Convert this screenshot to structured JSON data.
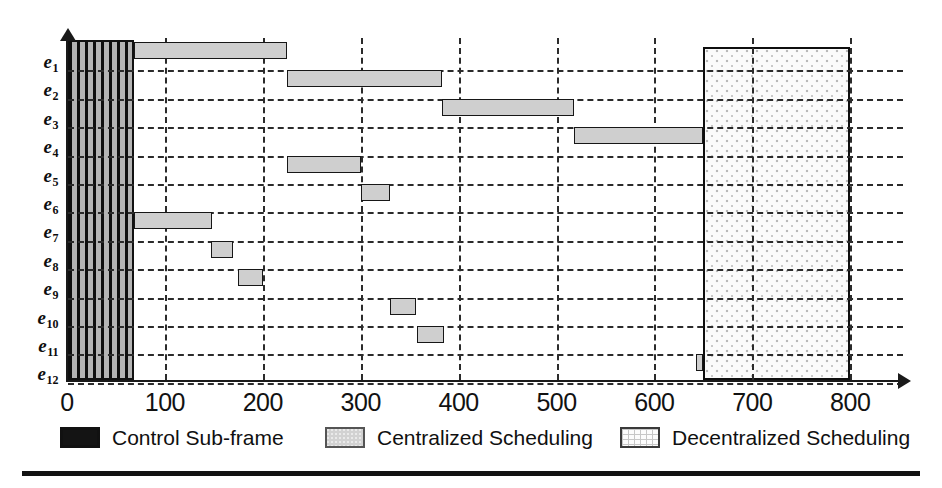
{
  "figure": {
    "title": "",
    "y_axis_label": "",
    "x_axis_label": ""
  },
  "chart_data": {
    "type": "bar",
    "orientation": "horizontal",
    "subtype": "gantt-schedule",
    "title": "",
    "xlabel": "",
    "ylabel": "",
    "xlim": [
      0,
      840
    ],
    "grid": true,
    "xticks": [
      0,
      100,
      200,
      300,
      400,
      500,
      600,
      700,
      800
    ],
    "xticklabels": [
      "0",
      "100",
      "200",
      "300",
      "400",
      "500",
      "600",
      "700",
      "800"
    ],
    "categories": [
      "e1",
      "e2",
      "e3",
      "e4",
      "e5",
      "e6",
      "e7",
      "e8",
      "e9",
      "e10",
      "e11",
      "e12"
    ],
    "category_labels": [
      {
        "base": "e",
        "sub": "1"
      },
      {
        "base": "e",
        "sub": "2"
      },
      {
        "base": "e",
        "sub": "3"
      },
      {
        "base": "e",
        "sub": "4"
      },
      {
        "base": "e",
        "sub": "5"
      },
      {
        "base": "e",
        "sub": "6"
      },
      {
        "base": "e",
        "sub": "7"
      },
      {
        "base": "e",
        "sub": "8"
      },
      {
        "base": "e",
        "sub": "9"
      },
      {
        "base": "e",
        "sub": "10"
      },
      {
        "base": "e",
        "sub": "11"
      },
      {
        "base": "e",
        "sub": "12"
      }
    ],
    "series": [
      {
        "name": "Centralized Scheduling",
        "color": "#cfcfcf",
        "tasks": [
          {
            "category": "e1",
            "start": 68,
            "end": 225
          },
          {
            "category": "e2",
            "start": 225,
            "end": 383
          },
          {
            "category": "e3",
            "start": 383,
            "end": 518
          },
          {
            "category": "e4",
            "start": 518,
            "end": 650
          },
          {
            "category": "e5",
            "start": 225,
            "end": 300
          },
          {
            "category": "e6",
            "start": 300,
            "end": 330
          },
          {
            "category": "e7",
            "start": 68,
            "end": 148
          },
          {
            "category": "e8",
            "start": 147,
            "end": 170
          },
          {
            "category": "e9",
            "start": 175,
            "end": 200
          },
          {
            "category": "e10",
            "start": 330,
            "end": 357
          },
          {
            "category": "e11",
            "start": 357,
            "end": 385
          },
          {
            "category": "e12",
            "start": 643,
            "end": 650
          }
        ]
      }
    ],
    "regions": [
      {
        "name": "Control Sub-frame",
        "start": 0,
        "end": 68,
        "fill": "vertical-stripes"
      },
      {
        "name": "Decentralized Scheduling",
        "start": 650,
        "end": 800,
        "fill": "dotted"
      }
    ]
  },
  "legend": {
    "position": "bottom",
    "items": [
      {
        "label": "Control Sub-frame",
        "swatch": "solid-black",
        "color": "#141414"
      },
      {
        "label": "Centralized Scheduling",
        "swatch": "light-gray",
        "color": "#d2d2d2"
      },
      {
        "label": "Decentralized Scheduling",
        "swatch": "dotted-grid",
        "color": "#fcfcfc"
      }
    ]
  }
}
